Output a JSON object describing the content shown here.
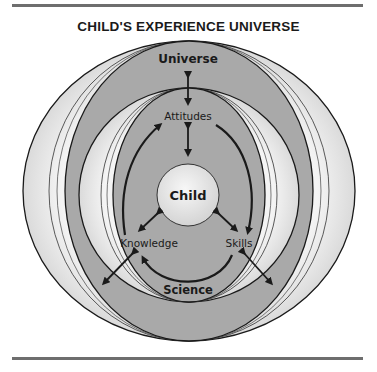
{
  "figure": {
    "title": "CHILD'S EXPERIENCE UNIVERSE",
    "labels": {
      "universe": "Universe",
      "attitudes": "Attitudes",
      "child": "Child",
      "knowledge": "Knowledge",
      "skills": "Skills",
      "science": "Science"
    },
    "colors": {
      "ring_light": "#e6e6e6",
      "ring_dark": "#a9a9a9",
      "child_fill": "#e8e8e8",
      "stroke": "#1a1a1a",
      "rule": "#6e6e6e"
    }
  }
}
